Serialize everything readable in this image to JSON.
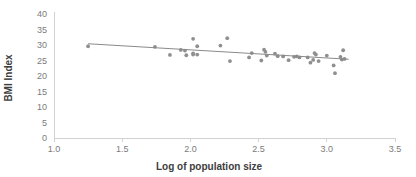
{
  "chart_data": {
    "type": "scatter",
    "title": "",
    "xlabel": "Log of population size",
    "ylabel": "BMI Index",
    "xlim": [
      1.0,
      3.5
    ],
    "ylim": [
      0,
      40
    ],
    "xticks": [
      "1.0",
      "1.5",
      "2.0",
      "2.5",
      "3.0",
      "3.5"
    ],
    "xtick_values": [
      1.0,
      1.5,
      2.0,
      2.5,
      3.0,
      3.5
    ],
    "yticks": [
      "0",
      "5",
      "10",
      "15",
      "20",
      "25",
      "30",
      "35",
      "40"
    ],
    "ytick_values": [
      0,
      5,
      10,
      15,
      20,
      25,
      30,
      35,
      40
    ],
    "grid": false,
    "legend": false,
    "point_color": "#8f8f8f",
    "trendline_color": "#8a8a8a",
    "axis_color": "#d2d2d2",
    "label_color": "#7b7b7b",
    "title_color": "#3d3d3d",
    "series": [
      {
        "name": "BMI vs log population",
        "marker": "circle",
        "points": [
          [
            1.25,
            29.6
          ],
          [
            1.74,
            29.4
          ],
          [
            1.85,
            26.8
          ],
          [
            1.93,
            28.4
          ],
          [
            1.96,
            28.2
          ],
          [
            1.97,
            26.7
          ],
          [
            2.02,
            32.0
          ],
          [
            2.02,
            27.3
          ],
          [
            2.02,
            26.9
          ],
          [
            2.05,
            29.6
          ],
          [
            2.05,
            26.9
          ],
          [
            2.22,
            29.8
          ],
          [
            2.27,
            32.2
          ],
          [
            2.29,
            24.8
          ],
          [
            2.43,
            26.0
          ],
          [
            2.45,
            27.4
          ],
          [
            2.52,
            25.0
          ],
          [
            2.54,
            28.5
          ],
          [
            2.55,
            27.8
          ],
          [
            2.56,
            26.6
          ],
          [
            2.62,
            27.2
          ],
          [
            2.64,
            26.4
          ],
          [
            2.68,
            26.3
          ],
          [
            2.72,
            25.1
          ],
          [
            2.76,
            26.2
          ],
          [
            2.78,
            26.3
          ],
          [
            2.8,
            26.0
          ],
          [
            2.86,
            26.0
          ],
          [
            2.88,
            24.3
          ],
          [
            2.9,
            25.2
          ],
          [
            2.91,
            27.4
          ],
          [
            2.92,
            26.9
          ],
          [
            2.94,
            24.8
          ],
          [
            3.0,
            26.6
          ],
          [
            3.05,
            23.4
          ],
          [
            3.06,
            20.9
          ],
          [
            3.1,
            26.2
          ],
          [
            3.11,
            25.3
          ],
          [
            3.12,
            28.3
          ],
          [
            3.13,
            25.5
          ]
        ]
      }
    ],
    "trendline": {
      "x_start": 1.25,
      "y_start": 30.4,
      "x_end": 3.16,
      "y_end": 25.4,
      "slope": -2.62,
      "intercept": 33.67
    }
  }
}
